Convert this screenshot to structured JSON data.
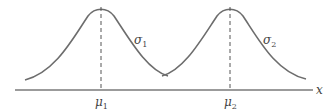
{
  "diagram": {
    "axis_label": "x",
    "curves": [
      {
        "name": "distribution-1",
        "mean_label": "μ",
        "mean_sub": "1",
        "sd_label": "σ",
        "sd_sub": "1"
      },
      {
        "name": "distribution-2",
        "mean_label": "μ",
        "mean_sub": "2",
        "sd_label": "σ",
        "sd_sub": "2"
      }
    ],
    "colors": {
      "curve": "#6d6d6d",
      "axis": "#7a7a7a",
      "text": "#444444"
    }
  }
}
